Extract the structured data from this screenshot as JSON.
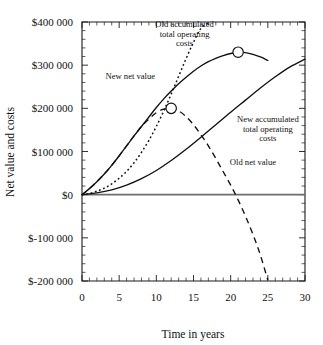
{
  "chart_data": {
    "type": "line",
    "title": "",
    "xlabel": "Time in years",
    "ylabel": "Net value and costs",
    "xlim": [
      0,
      30
    ],
    "ylim": [
      -200000,
      400000
    ],
    "grid": false,
    "legend_position": "inline-annotations",
    "x_ticks": [
      {
        "value": 0,
        "label": "0"
      },
      {
        "value": 5,
        "label": "5"
      },
      {
        "value": 10,
        "label": "10"
      },
      {
        "value": 15,
        "label": "15"
      },
      {
        "value": 20,
        "label": "20"
      },
      {
        "value": 25,
        "label": "25"
      },
      {
        "value": 30,
        "label": "30"
      }
    ],
    "y_ticks": [
      {
        "value": 400000,
        "label": "$400 000"
      },
      {
        "value": 300000,
        "label": "$300 000"
      },
      {
        "value": 200000,
        "label": "$200 000"
      },
      {
        "value": 100000,
        "label": "$100 000"
      },
      {
        "value": 0,
        "label": "$0"
      },
      {
        "value": -100000,
        "label": "$-100 000"
      },
      {
        "value": -200000,
        "label": "$-200 000"
      }
    ],
    "zero_reference_line": 0,
    "series": [
      {
        "name": "New net value",
        "style": "solid",
        "label_text": "New net value",
        "label_x": 6.5,
        "label_y": 268000,
        "x": [
          0,
          1,
          2,
          3,
          4,
          5,
          6,
          7,
          8,
          9,
          10,
          11,
          12,
          13,
          14,
          15,
          16,
          17,
          18,
          19,
          20,
          21,
          22,
          23,
          24,
          25
        ],
        "y": [
          0,
          14000,
          30000,
          48000,
          68000,
          90000,
          113000,
          136000,
          158000,
          180000,
          202000,
          222000,
          240000,
          257000,
          272000,
          286000,
          298000,
          308000,
          316000,
          322000,
          327000,
          330000,
          329000,
          325000,
          319000,
          311000
        ]
      },
      {
        "name": "Old net value",
        "style": "dashed",
        "label_text": "Old net value",
        "label_x": 23.0,
        "label_y": 68000,
        "x": [
          0,
          1,
          2,
          3,
          4,
          5,
          6,
          7,
          8,
          9,
          10,
          11,
          12,
          13,
          14,
          15,
          16,
          17,
          18,
          19,
          20,
          21,
          22,
          23,
          24,
          25
        ],
        "y": [
          0,
          14000,
          30000,
          48000,
          68000,
          90000,
          113000,
          136000,
          158000,
          175000,
          190000,
          198000,
          200000,
          194000,
          181000,
          162000,
          139000,
          113000,
          84000,
          53000,
          22000,
          -12000,
          -50000,
          -92000,
          -140000,
          -198000
        ]
      },
      {
        "name": "Old accumulated total operating costs",
        "style": "dotted",
        "label_text": "Old accumulated\ntotal operating\ncosts",
        "label_x": 13.8,
        "label_y": 388000,
        "x": [
          0,
          1,
          2,
          3,
          4,
          5,
          6,
          7,
          8,
          9,
          10,
          11,
          12,
          13,
          14,
          15,
          16,
          17,
          17.5
        ],
        "y": [
          0,
          3000,
          8000,
          15000,
          25000,
          38000,
          54000,
          74000,
          98000,
          126000,
          158000,
          194000,
          233000,
          274000,
          315000,
          353000,
          385000,
          399000,
          404000
        ]
      },
      {
        "name": "New accumulated total operating costs",
        "style": "solid",
        "label_text": "New accumulated\ntotal operating\ncosts",
        "label_x": 25.0,
        "label_y": 168000,
        "x": [
          0,
          2,
          4,
          6,
          8,
          10,
          12,
          14,
          16,
          18,
          20,
          22,
          24,
          26,
          28,
          30
        ],
        "y": [
          0,
          4000,
          11000,
          22000,
          37000,
          56000,
          79000,
          105000,
          133000,
          162000,
          191000,
          219000,
          247000,
          273000,
          296000,
          314000
        ]
      }
    ],
    "markers": [
      {
        "label": "old-net-value-peak",
        "x": 12,
        "y": 200000
      },
      {
        "label": "new-net-value-peak",
        "x": 21,
        "y": 330000
      }
    ]
  }
}
